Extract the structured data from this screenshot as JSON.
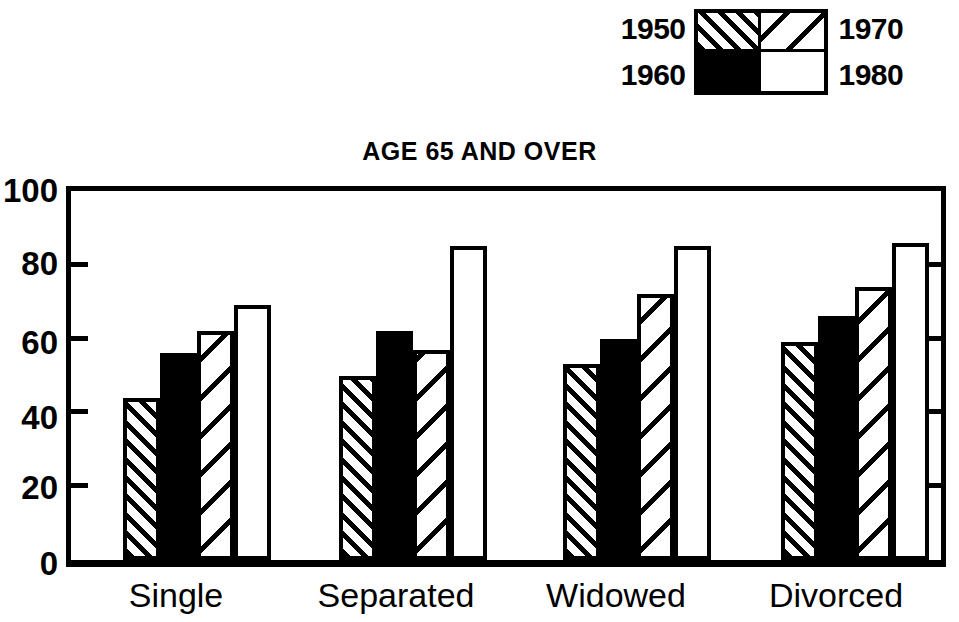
{
  "chart_data": {
    "type": "bar",
    "title": "AGE 65 AND OVER",
    "xlabel": "",
    "ylabel": "",
    "ylim": [
      0,
      100
    ],
    "yticks": [
      0,
      20,
      40,
      60,
      80,
      100
    ],
    "grid": false,
    "legend_position": "top-right",
    "categories": [
      "Single",
      "Separated",
      "Widowed",
      "Divorced"
    ],
    "series": [
      {
        "name": "1950",
        "pattern": "dense-diagonal-hatch",
        "values": [
          44,
          50,
          53,
          59
        ]
      },
      {
        "name": "1960",
        "pattern": "solid-black",
        "values": [
          56,
          62,
          60,
          66
        ]
      },
      {
        "name": "1970",
        "pattern": "sparse-diagonal-hatch",
        "values": [
          62,
          57,
          72,
          74
        ]
      },
      {
        "name": "1980",
        "pattern": "white-open",
        "values": [
          69,
          85,
          85,
          86
        ]
      }
    ]
  },
  "legend": {
    "year_1950": "1950",
    "year_1960": "1960",
    "year_1970": "1970",
    "year_1980": "1980"
  },
  "axis": {
    "y_tick_0": "0",
    "y_tick_20": "20",
    "y_tick_40": "40",
    "y_tick_60": "60",
    "y_tick_80": "80",
    "y_tick_100": "100"
  },
  "categories": {
    "cat_0": "Single",
    "cat_1": "Separated",
    "cat_2": "Widowed",
    "cat_3": "Divorced"
  },
  "colors": {
    "ink": "#000000",
    "paper": "#ffffff"
  }
}
